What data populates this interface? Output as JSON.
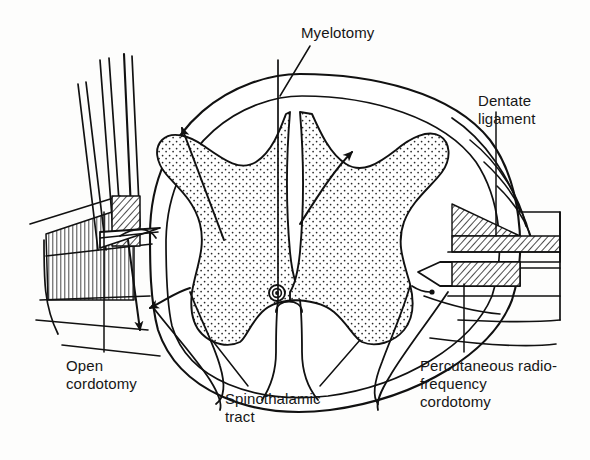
{
  "figure": {
    "background_color": "#fdfdfc",
    "ink_color": "#111111",
    "width": 590,
    "height": 460
  },
  "labels": {
    "myelotomy": "Myelotomy",
    "dentate_ligament": "Dentate\nligament",
    "open_cordotomy": "Open\ncordotomy",
    "spinothalamic_tract": "Spinothalamic\ntract",
    "percutaneous_rf_cordotomy": "Percutaneous radio-\nfrequency\ncordotomy"
  },
  "anatomy": {
    "gray_matter": {
      "name": "butterfly-shaped gray matter",
      "fill": "stipple",
      "stipple_color": "#222222"
    },
    "white_matter": {
      "name": "white matter",
      "fill": "#ffffff"
    },
    "central_canal": {
      "name": "central canal",
      "shape": "concentric-circles"
    },
    "cord_outline": {
      "name": "spinal cord outline",
      "shape": "oval"
    }
  },
  "instruments": {
    "needles": {
      "name": "open cordotomy knife and retractor instruments",
      "count": 4,
      "side": "left"
    },
    "rf_electrode": {
      "name": "percutaneous radiofrequency electrode",
      "fill": "hatched",
      "side": "right"
    },
    "dentate_ligament_band": {
      "name": "dentate ligament hatched band",
      "fill": "hatched",
      "side": "right"
    }
  },
  "annotations": {
    "arrows": [
      {
        "name": "left-anterolateral-lesion-arrow",
        "direction": "up-right"
      },
      {
        "name": "right-anterolateral-lesion-arrow",
        "direction": "up-right"
      },
      {
        "name": "left-knife-cut-arrow",
        "direction": "down"
      },
      {
        "name": "left-curved-tract-arrow",
        "direction": "down-left"
      },
      {
        "name": "rf-electrode-tip-arrow",
        "direction": "left"
      }
    ]
  }
}
